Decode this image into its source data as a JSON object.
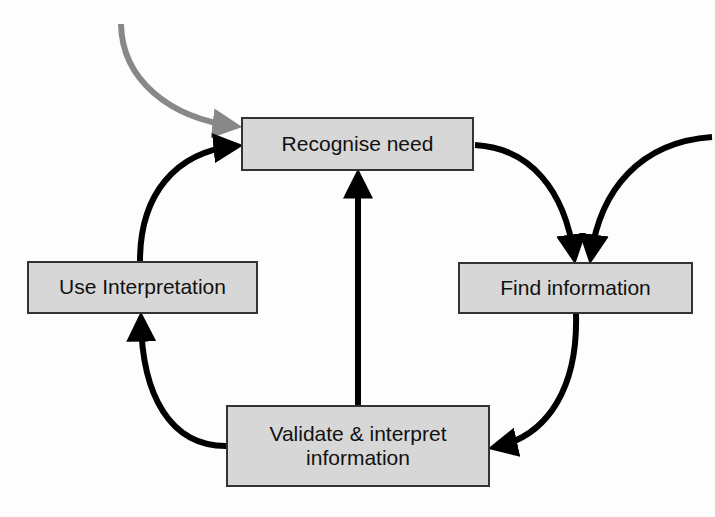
{
  "diagram": {
    "type": "cycle",
    "nodes": [
      {
        "id": "recognise",
        "label": "Recognise need"
      },
      {
        "id": "find",
        "label": "Find information"
      },
      {
        "id": "validate",
        "label": "Validate & interpret\ninformation",
        "line1": "Validate & interpret",
        "line2": "information"
      },
      {
        "id": "use",
        "label": "Use Interpretation"
      }
    ],
    "edges": [
      {
        "from": "recognise",
        "to": "find"
      },
      {
        "from": "find",
        "to": "validate"
      },
      {
        "from": "validate",
        "to": "use"
      },
      {
        "from": "use",
        "to": "recognise"
      },
      {
        "from": "validate",
        "to": "recognise"
      },
      {
        "from": "external-top-left",
        "to": "recognise",
        "color": "#888888"
      },
      {
        "from": "external-right",
        "to": "find"
      }
    ],
    "colors": {
      "box_fill": "#d7d7d7",
      "box_border": "#333333",
      "arrow": "#000000",
      "entry_arrow": "#888888"
    }
  }
}
